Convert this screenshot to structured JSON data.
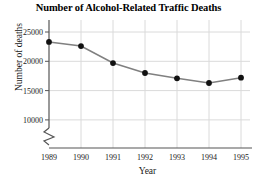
{
  "chart_data": {
    "type": "line",
    "title": "Number of Alcohol-Related Traffic Deaths",
    "xlabel": "Year",
    "ylabel": "Number of deaths",
    "categories": [
      "1989",
      "1990",
      "1991",
      "1992",
      "1993",
      "1994",
      "1995"
    ],
    "values": [
      23300,
      22600,
      19700,
      18000,
      17100,
      16300,
      17200
    ],
    "series": [
      {
        "name": "Alcohol-related traffic deaths",
        "values": [
          23300,
          22600,
          19700,
          18000,
          17100,
          16300,
          17200
        ]
      }
    ],
    "xlim": [
      1988.6,
      1995.4
    ],
    "ylim": [
      9000,
      26000
    ],
    "ytick_labels": [
      "10000",
      "15000",
      "20000",
      "25000"
    ],
    "ytick_values": [
      10000,
      15000,
      20000,
      25000
    ],
    "xtick_labels": [
      "1989",
      "1990",
      "1991",
      "1992",
      "1993",
      "1994",
      "1995"
    ],
    "grid": true,
    "y_axis_break": true,
    "legend": "none",
    "colors": {
      "line": "#808080",
      "marker": "#111111",
      "grid": "#d8d8d8",
      "axis": "#555555",
      "text": "#1a1a1a"
    }
  }
}
